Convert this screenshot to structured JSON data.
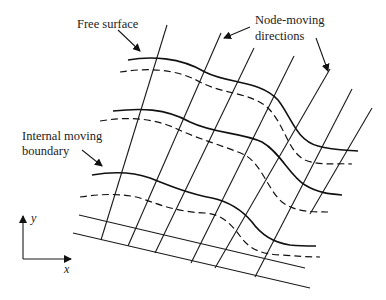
{
  "diagram": {
    "type": "mesh-schematic",
    "labels": {
      "free_surface": "Free surface",
      "node_moving_line1": "Node-moving",
      "node_moving_line2": "directions",
      "internal_line1": "Internal moving",
      "internal_line2": "boundary",
      "axis_x": "x",
      "axis_y": "y"
    },
    "elements": {
      "node_moving_direction_lines": 7,
      "solid_interface_curves": 3,
      "dashed_interface_curves": 3,
      "straight_bottom_lines": 2
    },
    "colors": {
      "line": "#111111",
      "text": "#222222",
      "background": "#ffffff"
    }
  }
}
